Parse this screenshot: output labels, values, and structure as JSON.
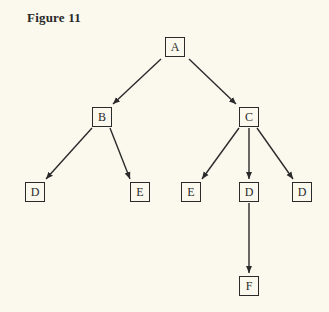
{
  "figure": {
    "title": "Figure 11"
  },
  "tree": {
    "nodes": [
      {
        "id": "A",
        "label": "A",
        "x": 165,
        "y": 37
      },
      {
        "id": "B",
        "label": "B",
        "x": 92,
        "y": 107
      },
      {
        "id": "C",
        "label": "C",
        "x": 239,
        "y": 107
      },
      {
        "id": "D1",
        "label": "D",
        "x": 25,
        "y": 182
      },
      {
        "id": "E1",
        "label": "E",
        "x": 130,
        "y": 182
      },
      {
        "id": "E2",
        "label": "E",
        "x": 181,
        "y": 182
      },
      {
        "id": "D2",
        "label": "D",
        "x": 239,
        "y": 182
      },
      {
        "id": "D3",
        "label": "D",
        "x": 292,
        "y": 182
      },
      {
        "id": "F",
        "label": "F",
        "x": 239,
        "y": 276
      }
    ],
    "edges": [
      {
        "from": "A",
        "to": "B"
      },
      {
        "from": "A",
        "to": "C"
      },
      {
        "from": "B",
        "to": "D1"
      },
      {
        "from": "B",
        "to": "E1"
      },
      {
        "from": "C",
        "to": "E2"
      },
      {
        "from": "C",
        "to": "D2"
      },
      {
        "from": "C",
        "to": "D3"
      },
      {
        "from": "D2",
        "to": "F"
      }
    ],
    "line_color": "#2a2a2a"
  }
}
